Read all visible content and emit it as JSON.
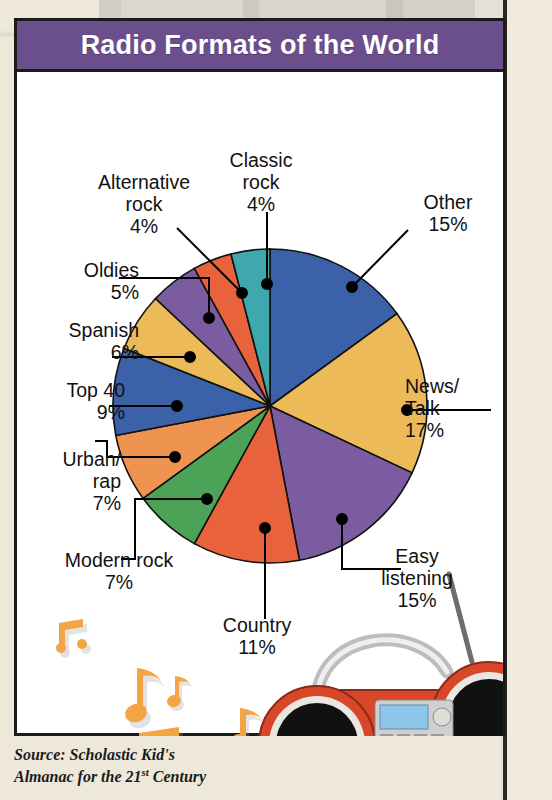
{
  "banner": {
    "title": "Radio Formats of the World"
  },
  "source": {
    "line1": "Source: Scholastic Kid's",
    "line2_pre": "Almanac for the 21",
    "line2_sup": "st",
    "line2_post": " Century"
  },
  "colors": {
    "banner_purple": "#6B4E8C",
    "card_border": "#1b1b1b",
    "page_bg": "#EDE8DA",
    "blue": "#3B62A8",
    "gold": "#EDBA5A",
    "purple": "#7B5CA0",
    "red": "#E8633C",
    "green": "#4CA357",
    "orange": "#EE9450",
    "teal": "#3FA8AE",
    "note_orange": "#F3A444",
    "radio_red": "#D9472B",
    "lcd_blue": "#8FC5E8"
  },
  "chart_data": {
    "type": "pie",
    "title": "Radio Formats of the World",
    "xlabel": "",
    "ylabel": "",
    "units": "percent",
    "legend_position": "callout-labels",
    "grid": false,
    "start_angle_deg": 0,
    "direction": "clockwise",
    "categories": [
      "Other",
      "News/Talk",
      "Easy listening",
      "Country",
      "Modern rock",
      "Urban/rap",
      "Top 40",
      "Spanish",
      "Oldies",
      "Alternative rock",
      "Classic rock"
    ],
    "values": [
      15,
      17,
      15,
      11,
      7,
      7,
      9,
      6,
      5,
      4,
      4
    ],
    "total": 100,
    "slices": [
      {
        "label": "Other",
        "label_lines": "Other\n15%",
        "value": 15,
        "display": "15%",
        "color": "#3B62A8"
      },
      {
        "label": "News/Talk",
        "label_lines": "News/\nTalk\n17%",
        "value": 17,
        "display": "17%",
        "color": "#EDBA5A"
      },
      {
        "label": "Easy listening",
        "label_lines": "Easy\nlistening\n15%",
        "value": 15,
        "display": "15%",
        "color": "#7B5CA0"
      },
      {
        "label": "Country",
        "label_lines": "Country\n11%",
        "value": 11,
        "display": "11%",
        "color": "#E8633C"
      },
      {
        "label": "Modern rock",
        "label_lines": "Modern rock\n7%",
        "value": 7,
        "display": "7%",
        "color": "#4CA357"
      },
      {
        "label": "Urban/rap",
        "label_lines": "Urban/\nrap\n7%",
        "value": 7,
        "display": "7%",
        "color": "#EE9450"
      },
      {
        "label": "Top 40",
        "label_lines": "Top 40\n9%",
        "value": 9,
        "display": "9%",
        "color": "#3B62A8"
      },
      {
        "label": "Spanish",
        "label_lines": "Spanish\n6%",
        "value": 6,
        "display": "6%",
        "color": "#EDBA5A"
      },
      {
        "label": "Oldies",
        "label_lines": "Oldies\n5%",
        "value": 5,
        "display": "5%",
        "color": "#7B5CA0"
      },
      {
        "label": "Alternative rock",
        "label_lines": "Alternative\nrock\n4%",
        "value": 4,
        "display": "4%",
        "color": "#E8633C"
      },
      {
        "label": "Classic rock",
        "label_lines": "Classic\nrock\n4%",
        "value": 4,
        "display": "4%",
        "color": "#3FA8AE"
      }
    ]
  },
  "decorations": {
    "music_notes": "music-notes",
    "radio": "boombox-radio"
  }
}
